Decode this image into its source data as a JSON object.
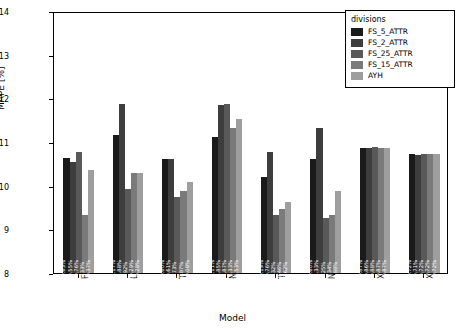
{
  "chart_data": {
    "type": "bar",
    "title": "",
    "xlabel": "Model",
    "ylabel": "MAPE [%]",
    "ylim": [
      8,
      14
    ],
    "yticks": [
      8,
      9,
      10,
      11,
      12,
      13,
      14
    ],
    "grid": false,
    "legend": {
      "title": "divisions",
      "position": "top-right",
      "entries": [
        {
          "name": "FS_5_ATTR",
          "color": "#1a1a1a"
        },
        {
          "name": "FS_2_ATTR",
          "color": "#3d3d3d"
        },
        {
          "name": "FS_25_ATTR",
          "color": "#595959"
        },
        {
          "name": "FS_15_ATTR",
          "color": "#7a7a7a"
        },
        {
          "name": "AYH",
          "color": "#9e9e9e"
        }
      ]
    },
    "categories": [
      "FOR",
      "LIN",
      "TRE",
      "NEU",
      "TRE_BAG",
      "NN_BAG",
      "XGB",
      "XGB_"
    ],
    "series": [
      {
        "name": "FS_5_ATTR",
        "color": "#1a1a1a",
        "values": [
          10.63,
          11.17,
          10.6,
          11.11,
          10.19,
          10.6,
          10.87,
          10.72
        ],
        "labels": [
          "10.63%",
          "11.17%",
          "10.60%",
          "11.11%",
          "10.19%",
          "10.60%",
          "10.87%",
          "10.72%"
        ]
      },
      {
        "name": "FS_2_ATTR",
        "color": "#3d3d3d",
        "values": [
          10.55,
          11.88,
          10.61,
          11.85,
          10.76,
          11.33,
          10.86,
          10.71
        ],
        "labels": [
          "10.55%",
          "11.88%",
          "10.61%",
          "11.85%",
          "10.76%",
          "11.33%",
          "10.86%",
          "10.71%"
        ]
      },
      {
        "name": "FS_25_ATTR",
        "color": "#595959",
        "values": [
          10.76,
          9.92,
          9.73,
          11.87,
          9.32,
          9.25,
          10.88,
          10.72
        ],
        "labels": [
          "10.76%",
          "9.92%",
          "9.73%",
          "11.87%",
          "9.32%",
          "9.25%",
          "10.88%",
          "10.72%"
        ]
      },
      {
        "name": "FS_15_ATTR",
        "color": "#7a7a7a",
        "values": [
          9.33,
          10.29,
          9.87,
          11.33,
          9.46,
          9.34,
          10.87,
          10.72
        ],
        "labels": [
          "9.33%",
          "10.29%",
          "9.87%",
          "11.33%",
          "9.46%",
          "9.34%",
          "10.87%",
          "10.72%"
        ]
      },
      {
        "name": "AYH",
        "color": "#9e9e9e",
        "values": [
          10.37,
          10.28,
          10.08,
          11.53,
          9.62,
          9.88,
          10.87,
          10.72
        ],
        "labels": [
          "10.37%",
          "10.28%",
          "10.08%",
          "11.53%",
          "9.62%",
          "9.88%",
          "10.87%",
          "10.72%"
        ]
      }
    ]
  }
}
